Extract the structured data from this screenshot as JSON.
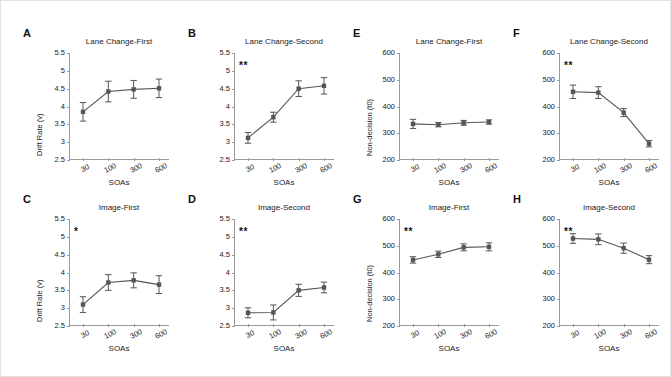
{
  "figure": {
    "background": "#ffffff",
    "border_color": "#e2e2e2",
    "marker_color": "#555555",
    "axis_color": "#9a9a9a"
  },
  "axes": {
    "soa_label": "SOAs",
    "drift_label": "Drift Rate (v)",
    "nondecision_label": "Non-decision (t0)",
    "soa_ticks": [
      "30",
      "100",
      "300",
      "600"
    ],
    "drift_ticks": [
      "5.5",
      "5",
      "4.5",
      "4",
      "3.5",
      "3",
      "2.5"
    ],
    "nondecision_ticks": [
      "600",
      "500",
      "400",
      "300",
      "200"
    ]
  },
  "chart_data": [
    {
      "id": "A",
      "type": "line",
      "letter": "A",
      "title": "Lane Change-First",
      "xlabel": "SOAs",
      "ylabel": "Drift Rate (v)",
      "categories": [
        "30",
        "100",
        "300",
        "600"
      ],
      "x": [
        30,
        100,
        300,
        600
      ],
      "values": [
        3.85,
        4.42,
        4.48,
        4.51
      ],
      "errors": [
        0.26,
        0.29,
        0.25,
        0.26
      ],
      "ylim": [
        2.5,
        5.5
      ],
      "yticks": [
        2.5,
        3,
        3.5,
        4,
        4.5,
        5,
        5.5
      ],
      "significance": "",
      "grid": false,
      "legend": "none"
    },
    {
      "id": "B",
      "type": "line",
      "letter": "B",
      "title": "Lane Change-Second",
      "xlabel": "SOAs",
      "ylabel": "",
      "categories": [
        "30",
        "100",
        "300",
        "600"
      ],
      "x": [
        30,
        100,
        300,
        600
      ],
      "values": [
        3.12,
        3.7,
        4.5,
        4.58
      ],
      "errors": [
        0.15,
        0.14,
        0.22,
        0.23
      ],
      "ylim": [
        2.5,
        5.5
      ],
      "yticks": [
        2.5,
        3,
        3.5,
        4,
        4.5,
        5,
        5.5
      ],
      "significance": "**",
      "grid": false,
      "legend": "none"
    },
    {
      "id": "C",
      "type": "line",
      "letter": "C",
      "title": "Image-First",
      "xlabel": "SOAs",
      "ylabel": "Drift Rate (v)",
      "categories": [
        "30",
        "100",
        "300",
        "600"
      ],
      "x": [
        30,
        100,
        300,
        600
      ],
      "values": [
        3.1,
        3.72,
        3.78,
        3.66
      ],
      "errors": [
        0.22,
        0.22,
        0.21,
        0.25
      ],
      "ylim": [
        2.5,
        5.5
      ],
      "yticks": [
        2.5,
        3,
        3.5,
        4,
        4.5,
        5,
        5.5
      ],
      "significance": "*",
      "grid": false,
      "legend": "none"
    },
    {
      "id": "D",
      "type": "line",
      "letter": "D",
      "title": "Image-Second",
      "xlabel": "SOAs",
      "ylabel": "",
      "categories": [
        "30",
        "100",
        "300",
        "600"
      ],
      "x": [
        30,
        100,
        300,
        600
      ],
      "values": [
        2.87,
        2.88,
        3.5,
        3.58
      ],
      "errors": [
        0.14,
        0.21,
        0.17,
        0.15
      ],
      "ylim": [
        2.5,
        5.5
      ],
      "yticks": [
        2.5,
        3,
        3.5,
        4,
        4.5,
        5,
        5.5
      ],
      "significance": "**",
      "grid": false,
      "legend": "none"
    },
    {
      "id": "E",
      "type": "line",
      "letter": "E",
      "title": "Lane Change-First",
      "xlabel": "SOAs",
      "ylabel": "Non-decision (t0)",
      "categories": [
        "30",
        "100",
        "300",
        "600"
      ],
      "x": [
        30,
        100,
        300,
        600
      ],
      "values": [
        335,
        332,
        339,
        342
      ],
      "errors": [
        17,
        8,
        9,
        8
      ],
      "ylim": [
        200,
        600
      ],
      "yticks": [
        200,
        300,
        400,
        500,
        600
      ],
      "significance": "",
      "grid": false,
      "legend": "none"
    },
    {
      "id": "F",
      "type": "line",
      "letter": "F",
      "title": "Lane Change-Second",
      "xlabel": "SOAs",
      "ylabel": "",
      "categories": [
        "30",
        "100",
        "300",
        "600"
      ],
      "x": [
        30,
        100,
        300,
        600
      ],
      "values": [
        455,
        452,
        377,
        261
      ],
      "errors": [
        25,
        22,
        15,
        12
      ],
      "ylim": [
        200,
        600
      ],
      "yticks": [
        200,
        300,
        400,
        500,
        600
      ],
      "significance": "**",
      "grid": false,
      "legend": "none"
    },
    {
      "id": "G",
      "type": "line",
      "letter": "G",
      "title": "Image-First",
      "xlabel": "SOAs",
      "ylabel": "Non-decision (t0)",
      "categories": [
        "30",
        "100",
        "300",
        "600"
      ],
      "x": [
        30,
        100,
        300,
        600
      ],
      "values": [
        447,
        468,
        494,
        496
      ],
      "errors": [
        12,
        12,
        13,
        15
      ],
      "ylim": [
        200,
        600
      ],
      "yticks": [
        200,
        300,
        400,
        500,
        600
      ],
      "significance": "**",
      "grid": false,
      "legend": "none"
    },
    {
      "id": "H",
      "type": "line",
      "letter": "H",
      "title": "Image-Second",
      "xlabel": "SOAs",
      "ylabel": "",
      "categories": [
        "30",
        "100",
        "300",
        "600"
      ],
      "x": [
        30,
        100,
        300,
        600
      ],
      "values": [
        527,
        524,
        491,
        448
      ],
      "errors": [
        18,
        20,
        19,
        15
      ],
      "ylim": [
        200,
        600
      ],
      "yticks": [
        200,
        300,
        400,
        500,
        600
      ],
      "significance": "**",
      "grid": false,
      "legend": "none"
    }
  ]
}
